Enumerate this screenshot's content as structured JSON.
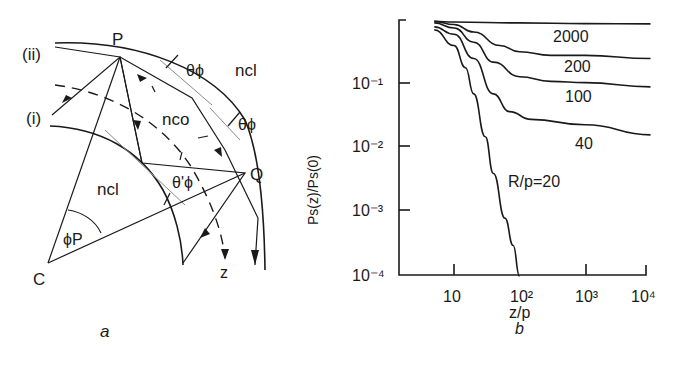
{
  "panel_a": {
    "caption": "a",
    "labels": {
      "ray_ii": "(ii)",
      "ray_i": "(i)",
      "point_p": "P",
      "point_q": "Q",
      "center_c": "C",
      "theta_phi_1": "θϕ",
      "theta_phi_2": "θϕ",
      "theta_phi_prime": "θ'ϕ",
      "n_cl_outer": "ncl",
      "n_co": "nco",
      "n_cl_inner": "ncl",
      "phi_p": "ϕP",
      "axis_z": "z"
    }
  },
  "panel_b": {
    "caption": "b"
  },
  "chart_data": {
    "type": "line",
    "title": "",
    "xlabel": "z/p",
    "ylabel": "Ps(z)/Ps(0)",
    "xscale": "log",
    "yscale": "log",
    "xlim": [
      1.4,
      10000
    ],
    "ylim": [
      0.0001,
      1
    ],
    "x_ticks": [
      "10",
      "10²",
      "10³",
      "10⁴"
    ],
    "y_ticks": [
      "10⁻¹",
      "10⁻²",
      "10⁻³",
      "10⁻⁴"
    ],
    "grid": false,
    "legend": "inline curve labels",
    "series": [
      {
        "name": "R/p=2000",
        "label": "2000",
        "x": [
          5,
          10,
          100,
          1000,
          10000
        ],
        "y": [
          0.95,
          0.93,
          0.9,
          0.88,
          0.87
        ]
      },
      {
        "name": "R/p=200",
        "label": "200",
        "x": [
          5,
          10,
          20,
          50,
          100,
          300,
          1000,
          10000
        ],
        "y": [
          0.95,
          0.85,
          0.65,
          0.4,
          0.32,
          0.28,
          0.28,
          0.25
        ]
      },
      {
        "name": "R/p=100",
        "label": "100",
        "x": [
          5,
          10,
          20,
          40,
          100,
          300,
          1000,
          10000
        ],
        "y": [
          0.9,
          0.75,
          0.45,
          0.22,
          0.13,
          0.11,
          0.105,
          0.09
        ]
      },
      {
        "name": "R/p=40",
        "label": "40",
        "x": [
          5,
          10,
          20,
          40,
          70,
          150,
          1000,
          10000
        ],
        "y": [
          0.78,
          0.6,
          0.25,
          0.07,
          0.037,
          0.028,
          0.023,
          0.016
        ]
      },
      {
        "name": "R/p=20",
        "label": "R/p=20",
        "x": [
          5,
          10,
          15,
          20,
          30,
          40,
          60,
          80,
          100
        ],
        "y": [
          0.7,
          0.4,
          0.18,
          0.07,
          0.015,
          0.004,
          0.0008,
          0.0003,
          0.0001
        ]
      }
    ]
  }
}
